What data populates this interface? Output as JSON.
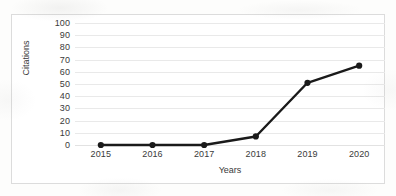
{
  "chart_data": {
    "type": "line",
    "title": "",
    "xlabel": "Years",
    "ylabel": "Citations",
    "categories": [
      "2015",
      "2016",
      "2017",
      "2018",
      "2019",
      "2020"
    ],
    "values": [
      0,
      0,
      0,
      7,
      51,
      65
    ],
    "series": [
      {
        "name": "Citations",
        "values": [
          0,
          0,
          0,
          7,
          51,
          65
        ]
      }
    ],
    "ylim": [
      0,
      100
    ],
    "y_ticks": [
      "0",
      "10",
      "20",
      "30",
      "40",
      "50",
      "60",
      "70",
      "80",
      "90",
      "100"
    ],
    "x_ticks": [
      "2015",
      "2016",
      "2017",
      "2018",
      "2019",
      "2020"
    ],
    "grid": "horizontal",
    "legend": "none",
    "line_color": "#1a1a1a",
    "marker": "circle",
    "marker_color": "#1a1a1a",
    "gridline_color": "#e9e9e9",
    "border_color": "#dcdcdc",
    "background_color": "#ffffff",
    "text_color": "#3a3a3a"
  }
}
